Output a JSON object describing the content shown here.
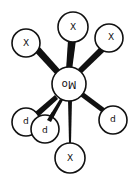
{
  "diagram": {
    "title": "",
    "orientation": "rotated-180",
    "central_atom": {
      "id": "c",
      "label": "Mo",
      "x": 69,
      "y": 84,
      "r": 17
    },
    "ligands": [
      {
        "id": "l0",
        "label": "X",
        "x": 73,
        "y": 27,
        "r": 15
      },
      {
        "id": "l1",
        "label": "X",
        "x": 26,
        "y": 43,
        "r": 14
      },
      {
        "id": "l2",
        "label": "X",
        "x": 109,
        "y": 38,
        "r": 14
      },
      {
        "id": "l3",
        "label": "p",
        "x": 26,
        "y": 122,
        "r": 14
      },
      {
        "id": "l4",
        "label": "p",
        "x": 45,
        "y": 129,
        "r": 14
      },
      {
        "id": "l5",
        "label": "p",
        "x": 113,
        "y": 120,
        "r": 14
      },
      {
        "id": "l6",
        "label": "X",
        "x": 70,
        "y": 158,
        "r": 15
      }
    ],
    "colors": {
      "stroke": "#111111",
      "fill": "#ffffff"
    }
  }
}
